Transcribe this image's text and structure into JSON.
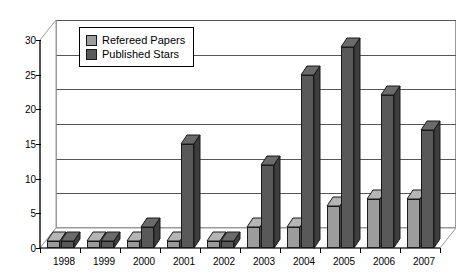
{
  "chart_data": {
    "type": "bar",
    "title": "",
    "xlabel": "",
    "ylabel": "",
    "categories": [
      "1998",
      "1999",
      "2000",
      "2001",
      "2002",
      "2003",
      "2004",
      "2005",
      "2006",
      "2007"
    ],
    "series": [
      {
        "name": "Refereed Papers",
        "color": "#9c9c9c",
        "values": [
          1,
          1,
          1,
          1,
          1,
          3,
          3,
          6,
          7,
          7
        ]
      },
      {
        "name": "Published Stars",
        "color": "#595959",
        "values": [
          1,
          1,
          3,
          15,
          1,
          12,
          25,
          29,
          22,
          17
        ]
      }
    ],
    "ylim": [
      0,
      30
    ],
    "yticks": [
      0,
      5,
      10,
      15,
      20,
      25,
      30
    ],
    "ytick_labels": [
      "0",
      "5",
      "10",
      "15",
      "20",
      "25",
      "30"
    ],
    "grid": true,
    "legend_position": "upper-left-inside",
    "style": "3d-clustered-column"
  },
  "legend": {
    "entries": [
      {
        "label": "Refereed Papers",
        "swatch": "light"
      },
      {
        "label": "Published Stars",
        "swatch": "dark"
      }
    ]
  }
}
